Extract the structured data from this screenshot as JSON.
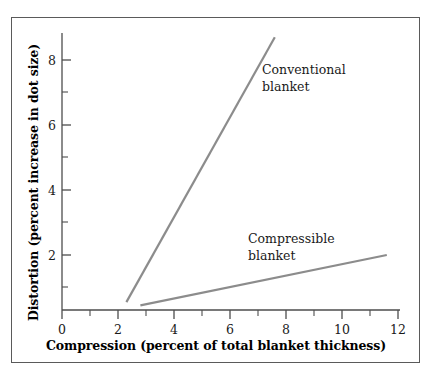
{
  "chart_data": {
    "type": "line",
    "title": "",
    "xlabel": "Compression (percent of total blanket thickness)",
    "ylabel": "Distortion (percent increase in dot size)",
    "xlim": [
      0,
      12
    ],
    "ylim": [
      0,
      9
    ],
    "grid": false,
    "legend_position": "inline-annotations",
    "x_ticks_major": [
      0,
      2,
      4,
      6,
      8,
      10,
      12
    ],
    "x_ticks_minor": [
      1,
      3,
      5,
      7,
      9,
      11
    ],
    "y_ticks_major": [
      2,
      4,
      6,
      8
    ],
    "y_ticks_minor": [
      1,
      3,
      5,
      7
    ],
    "line_color": "#8c8c8c",
    "axis_color": "#4d4d4d",
    "series": [
      {
        "name": "Conventional blanket",
        "label_lines": [
          "Conventional",
          "blanket"
        ],
        "x": [
          2.3,
          7.6
        ],
        "y": [
          0.55,
          8.7
        ]
      },
      {
        "name": "Compressible blanket",
        "label_lines": [
          "Compressible",
          "blanket"
        ],
        "x": [
          2.8,
          11.6
        ],
        "y": [
          0.45,
          2.0
        ]
      }
    ]
  },
  "axes": {
    "x_tick_labels": [
      "0",
      "2",
      "4",
      "6",
      "8",
      "10",
      "12"
    ],
    "y_tick_labels": [
      "2",
      "4",
      "6",
      "8"
    ],
    "x_title": "Compression (percent of total blanket thickness)",
    "y_title": "Distortion (percent increase in dot size)"
  },
  "annotations": {
    "conventional_line1": "Conventional",
    "conventional_line2": "blanket",
    "compressible_line1": "Compressible",
    "compressible_line2": "blanket"
  }
}
